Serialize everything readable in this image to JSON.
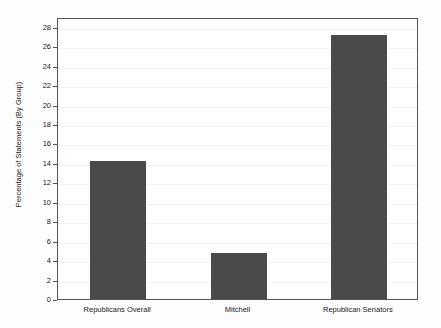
{
  "chart_data": {
    "type": "bar",
    "title": "",
    "xlabel": "",
    "ylabel": "Percentage of Statements (By Group)",
    "categories": [
      "Republicans Overall",
      "Mitchell",
      "Republican Senators"
    ],
    "values": [
      14.2,
      4.7,
      27.2
    ],
    "ylim": [
      0,
      29
    ],
    "yticks": [
      0,
      2,
      4,
      6,
      8,
      10,
      12,
      14,
      16,
      18,
      20,
      22,
      24,
      26,
      28
    ],
    "ytick_labels": [
      "0",
      "2",
      "4",
      "6",
      "8",
      "10",
      "12",
      "14",
      "16",
      "18",
      "20",
      "22",
      "24",
      "26",
      "28"
    ],
    "grid": true,
    "legend": null,
    "colors": {
      "bar_fill": "#4a4a4a",
      "plot_background": "#ffffff",
      "figure_background": "#fdfdfd",
      "axis_line": "#555555",
      "gridline": "#f2f2f2",
      "text": "#1a1a1a"
    }
  }
}
